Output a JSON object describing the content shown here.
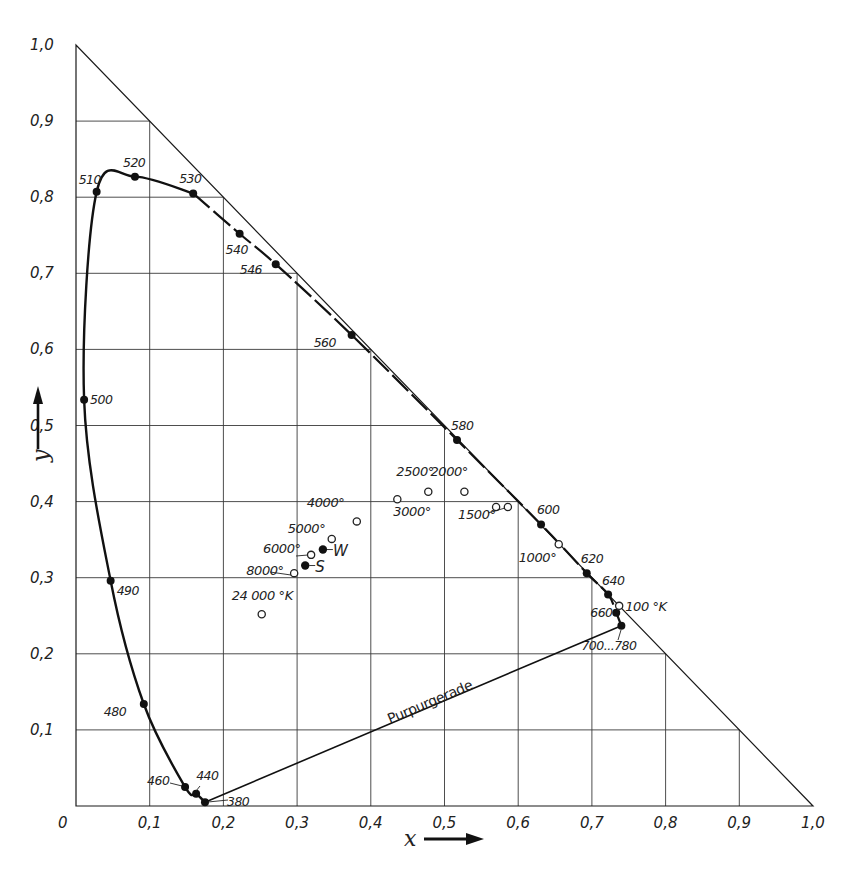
{
  "chart_data": {
    "type": "scatter",
    "title": "",
    "xlabel": "x",
    "ylabel": "y",
    "xlim": [
      0,
      1.0
    ],
    "ylim": [
      0,
      1.0
    ],
    "grid": true,
    "x_ticks": [
      "0",
      "0,1",
      "0,2",
      "0,3",
      "0,4",
      "0,5",
      "0,6",
      "0,7",
      "0,8",
      "0,9",
      "1,0"
    ],
    "y_ticks": [
      "0,1",
      "0,2",
      "0,3",
      "0,4",
      "0,5",
      "0,6",
      "0,7",
      "0,8",
      "0,9",
      "1,0"
    ],
    "origin_label": "0",
    "spectral_locus": {
      "name": "Spektralfarbenzug",
      "points": [
        {
          "label": "380",
          "x": 0.175,
          "y": 0.005
        },
        {
          "label": "440",
          "x": 0.163,
          "y": 0.016
        },
        {
          "label": "460",
          "x": 0.148,
          "y": 0.025
        },
        {
          "label": "480",
          "x": 0.092,
          "y": 0.134
        },
        {
          "label": "490",
          "x": 0.047,
          "y": 0.296
        },
        {
          "label": "500",
          "x": 0.011,
          "y": 0.534
        },
        {
          "label": "510",
          "x": 0.028,
          "y": 0.807
        },
        {
          "label": "520",
          "x": 0.08,
          "y": 0.827
        },
        {
          "label": "530",
          "x": 0.159,
          "y": 0.805
        },
        {
          "label": "540",
          "x": 0.222,
          "y": 0.752
        },
        {
          "label": "546",
          "x": 0.271,
          "y": 0.712
        },
        {
          "label": "560",
          "x": 0.374,
          "y": 0.619
        },
        {
          "label": "580",
          "x": 0.517,
          "y": 0.481
        },
        {
          "label": "600",
          "x": 0.631,
          "y": 0.37
        },
        {
          "label": "620",
          "x": 0.693,
          "y": 0.306
        },
        {
          "label": "640",
          "x": 0.722,
          "y": 0.278
        },
        {
          "label": "660",
          "x": 0.733,
          "y": 0.254
        },
        {
          "label": "700...780",
          "x": 0.74,
          "y": 0.237
        }
      ]
    },
    "purple_line": {
      "label": "Purpurgerade",
      "from": [
        0.175,
        0.005
      ],
      "to": [
        0.74,
        0.237
      ]
    },
    "planckian_locus": {
      "unit": "°K",
      "points": [
        {
          "label": "24 000 °K",
          "x": 0.252,
          "y": 0.252
        },
        {
          "label": "8000°",
          "x": 0.296,
          "y": 0.306
        },
        {
          "label": "6000°",
          "x": 0.319,
          "y": 0.33
        },
        {
          "label": "5000°",
          "x": 0.347,
          "y": 0.351
        },
        {
          "label": "4000°",
          "x": 0.381,
          "y": 0.374
        },
        {
          "label": "3000°",
          "x": 0.436,
          "y": 0.403
        },
        {
          "label": "2500°",
          "x": 0.478,
          "y": 0.413
        },
        {
          "label": "2000°",
          "x": 0.527,
          "y": 0.413
        },
        {
          "label": "1500°",
          "x": 0.57,
          "y": 0.393
        },
        {
          "label": "",
          "x": 0.586,
          "y": 0.393
        },
        {
          "label": "1000°",
          "x": 0.655,
          "y": 0.344
        },
        {
          "label": "100 °K",
          "x": 0.737,
          "y": 0.263
        }
      ]
    },
    "reference_points": [
      {
        "label": "W",
        "x": 0.335,
        "y": 0.337,
        "description": "equal-energy white"
      },
      {
        "label": "S",
        "x": 0.311,
        "y": 0.316,
        "description": "standard illuminant"
      }
    ],
    "triangle": {
      "vertices": [
        [
          0,
          0
        ],
        [
          1.0,
          0
        ],
        [
          0,
          1.0
        ]
      ]
    }
  }
}
